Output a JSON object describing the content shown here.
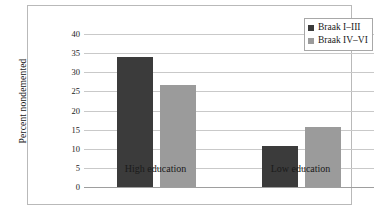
{
  "chart_data": {
    "type": "bar",
    "title": "",
    "xlabel": "",
    "ylabel": "Percent nondemented",
    "categories": [
      "High education",
      "Low education"
    ],
    "series": [
      {
        "name": "Braak I–III",
        "color": "#3b3b3b",
        "values": [
          34.0,
          10.7
        ]
      },
      {
        "name": "Braak IV–VI",
        "color": "#9b9b9b",
        "values": [
          26.8,
          15.8
        ]
      }
    ],
    "ylim": [
      0,
      40
    ],
    "ytick_step": 5,
    "ytick_labels": [
      "0",
      "5",
      "10",
      "15",
      "20",
      "25",
      "30",
      "35",
      "40"
    ],
    "ytick_values": [
      0,
      5,
      10,
      15,
      20,
      25,
      30,
      35,
      40
    ],
    "grid": true,
    "grid_axis": "y",
    "grid_color": "#c9c9c9",
    "legend_position": "top-right",
    "plot_background": "#ffffff",
    "frame_color": "#b9b9b9"
  }
}
